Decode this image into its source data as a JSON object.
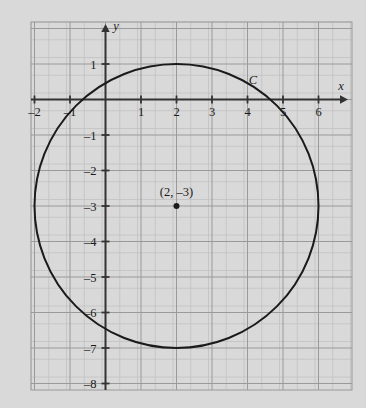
{
  "figure": {
    "background_color": "#d9d9d9",
    "grid": {
      "minor_color": "#c2c2c2",
      "major_color": "#9a9a9a",
      "frame": {
        "x0": 31,
        "y0": 22,
        "x1": 352,
        "y1": 390
      },
      "minor_step_px": 17.75,
      "major_step_px": 35.5,
      "show_minor": true,
      "show_major": true
    },
    "axes": {
      "color": "#333333",
      "origin_px": {
        "x": 105.5,
        "y": 99.5
      },
      "unit_px": 35.5,
      "x_axis": {
        "label": "x",
        "label_pos_px": {
          "x": 341,
          "y": 90
        },
        "arrow_end_px": {
          "x": 348,
          "y": 99.5
        },
        "start_px": {
          "x": 31,
          "y": 99.5
        },
        "tick_labels": [
          "-2",
          "-1",
          "1",
          "2",
          "3",
          "4",
          "5",
          "6"
        ],
        "tick_values": [
          -2,
          -1,
          1,
          2,
          3,
          4,
          5,
          6
        ]
      },
      "y_axis": {
        "label": "y",
        "label_pos_px": {
          "x": 116,
          "y": 30
        },
        "arrow_end_px": {
          "x": 105.5,
          "y": 24
        },
        "end_px": {
          "x": 105.5,
          "y": 390
        },
        "tick_labels": [
          "1",
          "-1",
          "-2",
          "-3",
          "-4",
          "-5",
          "-6",
          "-7",
          "-8"
        ],
        "tick_values": [
          1,
          -1,
          -2,
          -3,
          -4,
          -5,
          -6,
          -7,
          -8
        ]
      }
    }
  },
  "chart_data": {
    "type": "scatter",
    "title": "",
    "xlabel": "x",
    "ylabel": "y",
    "xlim": [
      -2.1,
      6.8
    ],
    "ylim": [
      -8.2,
      2.1
    ],
    "grid": true,
    "legend": "none",
    "xticks": [
      -2,
      -1,
      1,
      2,
      3,
      4,
      5,
      6
    ],
    "yticks": [
      1,
      -1,
      -2,
      -3,
      -4,
      -5,
      -6,
      -7,
      -8
    ],
    "xticklabels": [
      "-2",
      "-1",
      "1",
      "2",
      "3",
      "4",
      "5",
      "6"
    ],
    "yticklabels": [
      "1",
      "-1",
      "-2",
      "-3",
      "-4",
      "-5",
      "-6",
      "-7",
      "-8"
    ],
    "shapes": [
      {
        "kind": "circle",
        "name": "C",
        "label": "C",
        "center": [
          2,
          -3
        ],
        "radius": 4,
        "stroke": "#1a1a1a",
        "stroke_width": 2,
        "fill": "none",
        "label_position": [
          4.15,
          0.45
        ]
      }
    ],
    "points": [
      {
        "name": "center-point",
        "x": 2,
        "y": -3,
        "label": "(2, –3)",
        "label_offset_px": {
          "x": 0,
          "y": -10
        },
        "marker": "filled-circle",
        "color": "#1a1a1a",
        "size_px": 3
      }
    ],
    "annotations": [
      {
        "text": "C",
        "x": 4.15,
        "y": 0.45,
        "style": "italic"
      },
      {
        "text": "(2, –3)",
        "x": 2,
        "y": -2.7,
        "style": "normal"
      }
    ]
  }
}
